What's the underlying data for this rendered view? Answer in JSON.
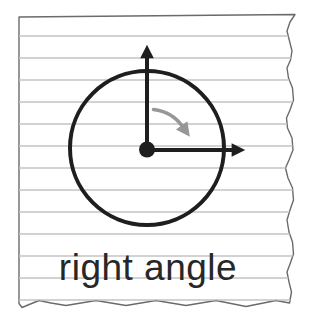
{
  "illustration": {
    "caption": "right angle",
    "figure": {
      "shape": "circle",
      "vertex": "center-dot",
      "rays": [
        "up-arrow",
        "right-arrow"
      ],
      "rotation_indicator": "clockwise arc arrow from vertical ray toward horizontal ray"
    },
    "background": "ruled notebook paper with torn right and bottom edges"
  },
  "colors": {
    "ink": "#1e1e1e",
    "rotation_arrow": "#979797",
    "ruled_line": "#c3c3c3",
    "paper_edge": "#6b6b6b",
    "paper_fill": "#ffffff",
    "caption_text": "#272727"
  }
}
